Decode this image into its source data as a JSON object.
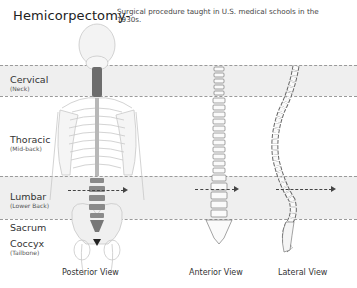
{
  "header": {
    "title": "Hemicorpectomy-",
    "subtitle": "Surgical  procedure taught in U.S. medical schools in the 1930s."
  },
  "regions": [
    {
      "name": "Cervical",
      "sub": "(Neck)"
    },
    {
      "name": "Thoracic",
      "sub": "(Mid-back)"
    },
    {
      "name": "Lumbar",
      "sub": "(Lower Back)"
    },
    {
      "name": "Sacrum",
      "sub": ""
    },
    {
      "name": "Coccyx",
      "sub": "(Tailbone)"
    }
  ],
  "views": [
    {
      "label": "Posterior View"
    },
    {
      "label": "Anterior View"
    },
    {
      "label": "Lateral View"
    }
  ],
  "colors": {
    "band": "#efefef",
    "highlight_spine": "#6d6d6d",
    "lumbar_spine": "#8a8a8a",
    "dash": "#9a9a9a"
  }
}
